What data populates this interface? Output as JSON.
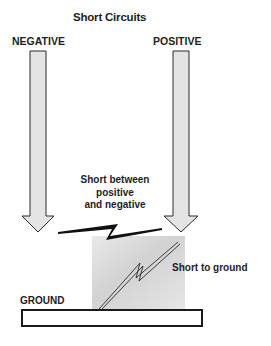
{
  "title": "Short Circuits",
  "labels": {
    "negative": "NEGATIVE",
    "positive": "POSITIVE",
    "short_between": "Short between positive and negative",
    "short_between_lines": [
      "Short between",
      "positive",
      "and negative"
    ],
    "short_to_ground": "Short to ground",
    "ground": "GROUND"
  },
  "colors": {
    "arrow_fill": "#e4e4e4",
    "outline": "#2a2a2a",
    "bolt": "#111111",
    "shade": "#cfcfcf"
  }
}
